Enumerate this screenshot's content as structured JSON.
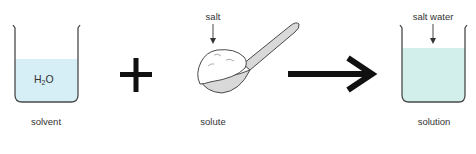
{
  "diagram": {
    "title": "",
    "colors": {
      "water": "#d6eef5",
      "salt_water": "#d3efec",
      "outline": "#4a4a4a",
      "operator": "#111111",
      "spoon": "#d9d9d9"
    },
    "items": [
      {
        "id": "solvent",
        "caption": "solvent",
        "inner_label_main": "H",
        "inner_label_sub": "2",
        "inner_label_end": "O"
      },
      {
        "id": "plus",
        "symbol": "plus"
      },
      {
        "id": "solute",
        "caption": "solute",
        "callout": "salt"
      },
      {
        "id": "arrow",
        "symbol": "right-arrow"
      },
      {
        "id": "solution",
        "caption": "solution",
        "callout": "salt water"
      }
    ]
  }
}
